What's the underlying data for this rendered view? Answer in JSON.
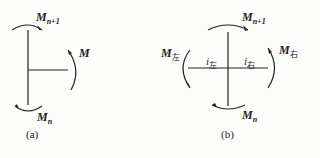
{
  "figure_a": {
    "caption": "(a)",
    "labels": {
      "top": {
        "main": "M",
        "sub": "n+1"
      },
      "right": {
        "main": "M",
        "sub": ""
      },
      "bottom": {
        "main": "M",
        "sub": "n"
      }
    }
  },
  "figure_b": {
    "caption": "(b)",
    "labels": {
      "top": {
        "main": "M",
        "sub": "n+1"
      },
      "left": {
        "main": "M",
        "sub": "左"
      },
      "right": {
        "main": "M",
        "sub": "右"
      },
      "bottom": {
        "main": "M",
        "sub": "n"
      },
      "i_left": {
        "main": "i",
        "sub": "左"
      },
      "i_right": {
        "main": "i",
        "sub": "右"
      }
    }
  },
  "colors": {
    "stroke": "#222222",
    "background": "#fdfdfb"
  }
}
